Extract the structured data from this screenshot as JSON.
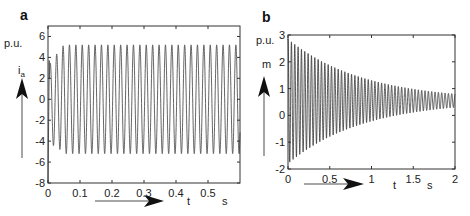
{
  "chart_data": [
    {
      "panel": "a",
      "type": "line",
      "title": "",
      "ylabel_unit": "p.u.",
      "ylabel": "i",
      "ylabel_sub": "a",
      "xlabel": "t",
      "xunit": "s",
      "xlim": [
        0,
        0.6
      ],
      "ylim": [
        -8,
        7
      ],
      "xticks": [
        0,
        0.1,
        0.2,
        0.3,
        0.4,
        0.5
      ],
      "yticks": [
        -8,
        -6,
        -4,
        -2,
        0,
        2,
        4,
        6
      ],
      "xtick_labels": [
        "0",
        "0.1",
        "0.2",
        "0.3",
        "0.4",
        "0.5"
      ],
      "ytick_labels": [
        "-8",
        "-6",
        "-4",
        "-2",
        "0",
        "2",
        "4",
        "6"
      ],
      "grid": false,
      "signal": {
        "description": "Sinusoidal current, ~50 Hz, steady amplitude ~5.2 p.u. after initial transient",
        "frequency_hz": 50,
        "steady_amplitude": 5.2,
        "initial_peak": 3.7,
        "initial_trough": -8,
        "first_trough": -6
      },
      "plot_box": {
        "x0": 48,
        "x1": 240,
        "y0": 26,
        "y1": 183
      }
    },
    {
      "panel": "b",
      "type": "line",
      "title": "",
      "ylabel_unit": "p.u.",
      "ylabel": "m",
      "xlabel": "t",
      "xunit": "s",
      "xlim": [
        0,
        2
      ],
      "ylim": [
        -2,
        3
      ],
      "xticks": [
        0,
        0.5,
        1,
        1.5,
        2
      ],
      "yticks": [
        -2,
        -1,
        0,
        1,
        2,
        3
      ],
      "xtick_labels": [
        "0",
        "0.5",
        "1",
        "1.5",
        "2"
      ],
      "ytick_labels": [
        "-2",
        "-1",
        "0",
        "1",
        "2",
        "3"
      ],
      "grid": false,
      "signal": {
        "description": "Decaying oscillation converging to ~0.55 p.u.",
        "frequency_hz": 25,
        "center": 0.55,
        "initial_upper": 2.85,
        "initial_lower": -1.8,
        "final_upper": 0.8,
        "final_lower": 0.3
      },
      "plot_box": {
        "x0": 288,
        "x1": 455,
        "y0": 35,
        "y1": 169
      }
    }
  ],
  "labels": {
    "panel_a": "a",
    "panel_b": "b",
    "a_unit": "p.u.",
    "a_ylabel": "i",
    "a_ylabel_sub": "a",
    "a_xlabel": "t",
    "a_xunit": "s",
    "b_unit": "p.u.",
    "b_ylabel": "m",
    "b_xlabel": "t",
    "b_xunit": "s"
  },
  "colors": {
    "trace": "#555555",
    "trace_b": "#333333",
    "axis": "#333333",
    "arrow": "#888888",
    "arrowhead": "#111111"
  }
}
